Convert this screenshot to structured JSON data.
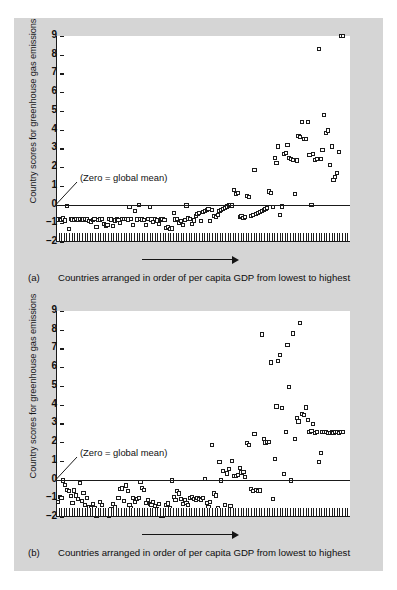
{
  "figure": {
    "background_color": "#d5d5d5",
    "plot_background_color": "#ffffff",
    "marker_color": "#1b1b1b",
    "axis_color": "#1a1a1a"
  },
  "panels": [
    {
      "id": "a",
      "tag": "(a)",
      "caption": "Countries arranged in order of per capita GDP from lowest to highest",
      "annotation": "(Zero = global mean)"
    },
    {
      "id": "b",
      "tag": "(b)",
      "caption": "Countries arranged in order of per capita GDP from lowest to highest",
      "annotation": "(Zero = global mean)"
    }
  ],
  "chart_data": [
    {
      "type": "scatter",
      "panel": "a",
      "title": "",
      "xlabel": "Countries arranged in order of per capita GDP from lowest to highest",
      "ylabel": "Country scores for greenhouse gas emissions",
      "annotations": [
        "(Zero = global mean)"
      ],
      "grid": false,
      "legend": "none",
      "ylim": [
        -2,
        9
      ],
      "yticks": [
        -2,
        -1,
        0,
        1,
        2,
        3,
        4,
        5,
        6,
        7,
        8,
        9
      ],
      "ytick_labels": [
        "–2",
        "–1",
        "0",
        "1",
        "2",
        "3",
        "4",
        "5",
        "6",
        "7",
        "8",
        "9"
      ],
      "xlim": [
        0,
        160
      ],
      "xticks": [],
      "x_axis_style": "hatched-band",
      "zero_reference_line": 0,
      "x": [
        1,
        2,
        3,
        4,
        5,
        6,
        7,
        8,
        9,
        10,
        11,
        12,
        13,
        14,
        15,
        16,
        17,
        18,
        19,
        20,
        21,
        22,
        23,
        24,
        25,
        26,
        27,
        28,
        29,
        30,
        31,
        32,
        33,
        34,
        35,
        36,
        37,
        38,
        39,
        40,
        41,
        42,
        43,
        44,
        45,
        46,
        47,
        48,
        49,
        50,
        51,
        52,
        53,
        54,
        55,
        56,
        57,
        58,
        59,
        60,
        61,
        62,
        63,
        64,
        65,
        66,
        67,
        68,
        69,
        70,
        71,
        72,
        73,
        74,
        75,
        76,
        77,
        78,
        79,
        80,
        81,
        82,
        83,
        84,
        85,
        86,
        87,
        88,
        89,
        90,
        91,
        92,
        93,
        94,
        95,
        96,
        97,
        98,
        99,
        100,
        101,
        102,
        103,
        104,
        105,
        106,
        107,
        108,
        109,
        110,
        111,
        112,
        113,
        114,
        115,
        116,
        117,
        118,
        119,
        120,
        121,
        122,
        123,
        124,
        125,
        126,
        127,
        128,
        129,
        130,
        131,
        132,
        133,
        134,
        135,
        136,
        137,
        138,
        139,
        140,
        141,
        142,
        143,
        144,
        145,
        146,
        147,
        148,
        149,
        150,
        151,
        152,
        153,
        154,
        155,
        156
      ],
      "y": [
        -0.8,
        -0.78,
        -0.82,
        -0.75,
        -0.85,
        -0.08,
        -1.3,
        -0.78,
        -0.8,
        -0.82,
        -0.79,
        -0.8,
        -0.76,
        -0.84,
        -0.8,
        -0.78,
        -0.8,
        -0.9,
        -0.95,
        -0.82,
        -0.78,
        -1.2,
        -0.82,
        -0.8,
        -0.78,
        -1.05,
        -1.12,
        -1.1,
        -0.78,
        -0.8,
        -1.15,
        -0.85,
        -0.8,
        -0.82,
        -1.0,
        -0.78,
        -0.76,
        -0.78,
        -0.8,
        -0.15,
        -0.78,
        -1.1,
        -0.35,
        -0.8,
        -0.02,
        -0.78,
        -0.8,
        -0.82,
        -1.1,
        -0.78,
        -0.15,
        -0.8,
        -0.95,
        -0.78,
        -0.85,
        -1.05,
        -0.8,
        -0.78,
        -0.82,
        -1.25,
        -1.2,
        -1.3,
        -1.28,
        -0.45,
        -0.8,
        -0.78,
        -1.0,
        -0.9,
        -1.1,
        -0.82,
        -0.05,
        -0.75,
        -0.78,
        -1.05,
        -0.85,
        -0.6,
        -0.5,
        -0.45,
        -0.9,
        -0.4,
        -0.35,
        -0.3,
        -0.25,
        -0.88,
        -0.3,
        -0.6,
        -0.65,
        -0.55,
        -0.35,
        -0.3,
        -0.25,
        -0.2,
        -0.1,
        -0.05,
        -0.02,
        -0.05,
        0.78,
        0.55,
        0.62,
        -0.65,
        -0.6,
        -0.72,
        -0.68,
        0.45,
        0.42,
        -0.6,
        -0.55,
        1.85,
        -0.5,
        -0.45,
        -0.4,
        -0.35,
        -0.3,
        -0.25,
        -0.2,
        0.7,
        0.62,
        -0.15,
        2.5,
        2.2,
        3.1,
        -0.55,
        -0.1,
        2.7,
        2.75,
        3.2,
        2.5,
        2.45,
        2.4,
        0.55,
        2.35,
        3.65,
        3.6,
        4.4,
        3.5,
        3.52,
        4.4,
        2.65,
        -0.02,
        2.7,
        2.4,
        2.42,
        8.3,
        2.45,
        2.9,
        4.78,
        3.8,
        3.95,
        2.1,
        3.1,
        1.3,
        1.45,
        1.7,
        2.8
      ]
    },
    {
      "type": "scatter",
      "panel": "b",
      "title": "",
      "xlabel": "Countries arranged in order of per capita GDP from lowest to highest",
      "ylabel": "Country scores for greenhouse gas emissions",
      "annotations": [
        "(Zero = global mean)"
      ],
      "grid": false,
      "legend": "none",
      "ylim": [
        -2,
        9
      ],
      "yticks": [
        -2,
        -1,
        0,
        1,
        2,
        3,
        4,
        5,
        6,
        7,
        8,
        9
      ],
      "ytick_labels": [
        "–2",
        "–1",
        "0",
        "1",
        "2",
        "3",
        "4",
        "5",
        "6",
        "7",
        "8",
        "9"
      ],
      "xlim": [
        0,
        160
      ],
      "xticks": [],
      "x_axis_style": "hatched-band",
      "zero_reference_line": 0,
      "x": [
        1,
        2,
        3,
        4,
        5,
        6,
        7,
        8,
        9,
        10,
        11,
        12,
        13,
        14,
        15,
        16,
        17,
        18,
        19,
        20,
        21,
        22,
        23,
        24,
        25,
        26,
        27,
        28,
        29,
        30,
        31,
        32,
        33,
        34,
        35,
        36,
        37,
        38,
        39,
        40,
        41,
        42,
        43,
        44,
        45,
        46,
        47,
        48,
        49,
        50,
        51,
        52,
        53,
        54,
        55,
        56,
        57,
        58,
        59,
        60,
        61,
        62,
        63,
        64,
        65,
        66,
        67,
        68,
        69,
        70,
        71,
        72,
        73,
        74,
        75,
        76,
        77,
        78,
        79,
        80,
        81,
        82,
        83,
        84,
        85,
        86,
        87,
        88,
        89,
        90,
        91,
        92,
        93,
        94,
        95,
        96,
        97,
        98,
        99,
        100,
        101,
        102,
        103,
        104,
        105,
        106,
        107,
        108,
        109,
        110,
        111,
        112,
        113,
        114,
        115,
        116,
        117,
        118,
        119,
        120,
        121,
        122,
        123,
        124,
        125,
        126,
        127,
        128,
        129,
        130,
        131,
        132,
        133,
        134,
        135,
        136,
        137,
        138,
        139,
        140,
        141,
        142,
        143,
        144,
        145,
        146,
        147,
        148,
        149,
        150,
        151,
        152,
        153,
        154,
        155,
        156
      ],
      "y": [
        -1.2,
        -0.95,
        -1.0,
        -0.05,
        -0.3,
        -0.55,
        -0.62,
        -0.9,
        -1.25,
        -0.58,
        -0.85,
        -1.05,
        -0.2,
        -1.15,
        -0.72,
        -1.35,
        -1.0,
        -1.45,
        -1.55,
        -1.3,
        -1.5,
        -1.95,
        -1.62,
        -1.2,
        -1.38,
        -1.72,
        -1.68,
        -1.78,
        -1.95,
        -1.6,
        -1.3,
        -1.45,
        -1.65,
        -1.0,
        -0.52,
        -0.48,
        -1.15,
        -0.32,
        -0.62,
        -1.35,
        -1.52,
        -1.0,
        -1.18,
        -1.05,
        -0.98,
        -0.12,
        -0.45,
        -0.55,
        -1.25,
        -1.1,
        -1.3,
        -1.35,
        -1.2,
        -1.42,
        -1.6,
        -1.3,
        -1.95,
        -1.92,
        -1.9,
        -1.35,
        -1.28,
        -1.52,
        -0.05,
        -0.95,
        -1.1,
        -0.6,
        -0.75,
        -1.05,
        -1.3,
        -1.12,
        -1.25,
        -1.38,
        -1.0,
        -0.95,
        -1.02,
        -1.08,
        -0.98,
        -1.05,
        -1.1,
        -1.0,
        0.02,
        -1.25,
        -1.45,
        -1.2,
        1.85,
        -0.75,
        -0.85,
        -1.55,
        0.95,
        -0.05,
        0.45,
        -1.35,
        0.32,
        0.55,
        -1.4,
        1.0,
        0.2,
        0.18,
        0.25,
        0.6,
        0.38,
        0.42,
        0.12,
        1.95,
        1.85,
        -0.5,
        -0.6,
        2.45,
        -0.55,
        -0.62,
        -0.58,
        7.75,
        2.15,
        1.98,
        2.0,
        2.0,
        6.25,
        -1.05,
        1.1,
        3.9,
        6.35,
        6.65,
        3.8,
        0.3,
        2.55,
        7.2,
        4.95,
        -0.05,
        7.8,
        2.15,
        3.3,
        3.1,
        8.35,
        3.5,
        3.45,
        3.85,
        3.2,
        2.55,
        2.6,
        2.95,
        2.5,
        2.55,
        0.95,
        1.4,
        2.55,
        2.52,
        2.55,
        2.5,
        2.48,
        2.55,
        2.5,
        2.52,
        2.55,
        2.5,
        2.52,
        2.55,
        2.5,
        2.5,
        2.52
      ]
    }
  ]
}
